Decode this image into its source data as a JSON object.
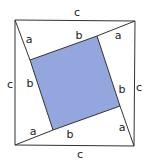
{
  "diagram": {
    "fill_color": "#93a7de",
    "stroke_color": "#333333",
    "outer_square": {
      "points": [
        [
          15,
          20
        ],
        [
          135,
          21
        ],
        [
          134,
          146
        ],
        [
          15,
          145
        ]
      ]
    },
    "inner_square": {
      "points": [
        [
          30,
          60
        ],
        [
          97,
          36
        ],
        [
          120,
          106
        ],
        [
          53,
          130
        ]
      ]
    },
    "labels": [
      {
        "text": "c",
        "x": 77,
        "y": 16
      },
      {
        "text": "a",
        "x": 29,
        "y": 43
      },
      {
        "text": "b",
        "x": 79,
        "y": 39
      },
      {
        "text": "a",
        "x": 118,
        "y": 39
      },
      {
        "text": "c",
        "x": 10,
        "y": 88
      },
      {
        "text": "b",
        "x": 30,
        "y": 87
      },
      {
        "text": "b",
        "x": 122,
        "y": 93
      },
      {
        "text": "c",
        "x": 139,
        "y": 91
      },
      {
        "text": "a",
        "x": 33,
        "y": 135
      },
      {
        "text": "b",
        "x": 70,
        "y": 138
      },
      {
        "text": "a",
        "x": 122,
        "y": 131
      },
      {
        "text": "c",
        "x": 80,
        "y": 158
      }
    ]
  }
}
